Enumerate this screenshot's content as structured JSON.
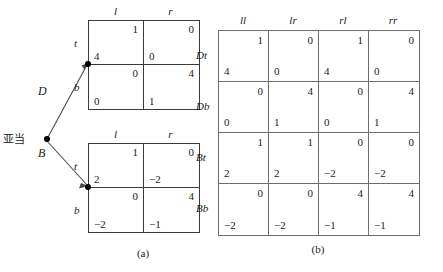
{
  "figure": {
    "caption_a": "(a)",
    "caption_b": "(b)"
  },
  "part_a": {
    "root_player_label": "亚当",
    "edges": [
      {
        "label": "D",
        "name": "edge-d"
      },
      {
        "label": "B",
        "name": "edge-b"
      }
    ],
    "matrices": [
      {
        "id": "matrix-d",
        "edge": "D",
        "col_headers": [
          "l",
          "r"
        ],
        "row_headers": [
          "t",
          "b"
        ],
        "cells": [
          {
            "row": "t",
            "col": "l",
            "row_payoff": "4",
            "col_payoff": "1"
          },
          {
            "row": "t",
            "col": "r",
            "row_payoff": "0",
            "col_payoff": "0"
          },
          {
            "row": "b",
            "col": "l",
            "row_payoff": "0",
            "col_payoff": "0"
          },
          {
            "row": "b",
            "col": "r",
            "row_payoff": "1",
            "col_payoff": "4"
          }
        ]
      },
      {
        "id": "matrix-b",
        "edge": "B",
        "col_headers": [
          "l",
          "r"
        ],
        "row_headers": [
          "t",
          "b"
        ],
        "cells": [
          {
            "row": "t",
            "col": "l",
            "row_payoff": "2",
            "col_payoff": "1"
          },
          {
            "row": "t",
            "col": "r",
            "row_payoff": "−2",
            "col_payoff": "0"
          },
          {
            "row": "b",
            "col": "l",
            "row_payoff": "−2",
            "col_payoff": "0"
          },
          {
            "row": "b",
            "col": "r",
            "row_payoff": "−1",
            "col_payoff": "4"
          }
        ]
      }
    ]
  },
  "part_b": {
    "col_headers": [
      "ll",
      "lr",
      "rl",
      "rr"
    ],
    "row_headers": [
      "Dt",
      "Db",
      "Bt",
      "Bb"
    ],
    "rows": [
      {
        "label": "Dt",
        "cells": [
          {
            "row_payoff": "4",
            "col_payoff": "1"
          },
          {
            "row_payoff": "0",
            "col_payoff": "0"
          },
          {
            "row_payoff": "4",
            "col_payoff": "1"
          },
          {
            "row_payoff": "0",
            "col_payoff": "0"
          }
        ]
      },
      {
        "label": "Db",
        "cells": [
          {
            "row_payoff": "0",
            "col_payoff": "0"
          },
          {
            "row_payoff": "1",
            "col_payoff": "4"
          },
          {
            "row_payoff": "0",
            "col_payoff": "0"
          },
          {
            "row_payoff": "1",
            "col_payoff": "4"
          }
        ]
      },
      {
        "label": "Bt",
        "cells": [
          {
            "row_payoff": "2",
            "col_payoff": "1"
          },
          {
            "row_payoff": "2",
            "col_payoff": "1"
          },
          {
            "row_payoff": "−2",
            "col_payoff": "0"
          },
          {
            "row_payoff": "−2",
            "col_payoff": "0"
          }
        ]
      },
      {
        "label": "Bb",
        "cells": [
          {
            "row_payoff": "−2",
            "col_payoff": "0"
          },
          {
            "row_payoff": "−2",
            "col_payoff": "0"
          },
          {
            "row_payoff": "−1",
            "col_payoff": "4"
          },
          {
            "row_payoff": "−1",
            "col_payoff": "4"
          }
        ]
      }
    ]
  },
  "colors": {
    "ink": "#1a1a1a",
    "rule_a": "#3a3a3a",
    "rule_b": "#6d6d6d",
    "background": "#ffffff"
  }
}
